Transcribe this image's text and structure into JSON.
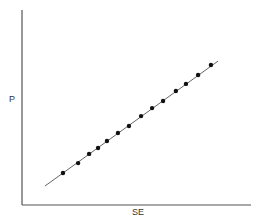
{
  "chart_data": {
    "type": "scatter",
    "title": "",
    "xlabel": "SE",
    "ylabel": "P",
    "xlim": [
      0,
      100
    ],
    "ylim": [
      0,
      100
    ],
    "grid": false,
    "legend": null,
    "ticks": {
      "x": [],
      "y": []
    },
    "series": [
      {
        "name": "data points",
        "marker": "filled-circle",
        "x": [
          17.9,
          24.5,
          29.3,
          33.2,
          37.1,
          41.9,
          46.7,
          52.0,
          56.8,
          61.6,
          67.2,
          71.6,
          76.9,
          82.5
        ],
        "y": [
          16.4,
          21.5,
          26.2,
          29.2,
          32.8,
          36.9,
          40.5,
          45.6,
          49.7,
          53.3,
          58.5,
          62.1,
          66.7,
          71.8
        ]
      }
    ],
    "fit_line": {
      "x": [
        10.0,
        85.6
      ],
      "y": [
        9.7,
        73.8
      ]
    }
  },
  "style": {
    "axis_color": "#555555",
    "line_color": "#666666",
    "point_color": "#111111"
  }
}
